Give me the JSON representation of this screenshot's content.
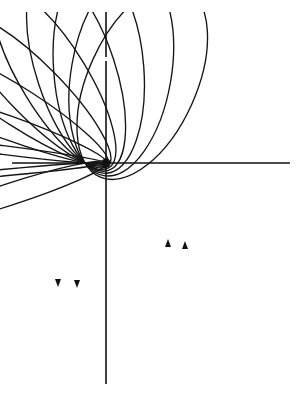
{
  "diagram": {
    "title": "",
    "colors": {
      "ink": "#151515",
      "background": "#ffffff"
    },
    "axes": {
      "horizontal": {
        "x1": 12,
        "x2": 290,
        "y": 163
      },
      "vertical": {
        "x": 106,
        "y1": 12,
        "y2": 384,
        "gap": [
          57,
          61
        ]
      }
    },
    "center_point": {
      "x": 106,
      "y": 163,
      "r": 4.5,
      "label": ""
    },
    "launch_point": {
      "x": 85,
      "y": 163
    },
    "semi_major_axis": 104,
    "launch_directions_deg": [
      -100,
      -93,
      -86,
      -79,
      -72,
      -65,
      -58,
      -51,
      -44,
      -37,
      -30
    ],
    "clip": {
      "x": 0,
      "y": 12,
      "width": 300,
      "height": 381
    },
    "arrows": [
      {
        "x": 168,
        "y": 244,
        "direction": "up"
      },
      {
        "x": 185,
        "y": 246,
        "direction": "up"
      },
      {
        "x": 58,
        "y": 282,
        "direction": "down"
      },
      {
        "x": 77,
        "y": 283,
        "direction": "down"
      }
    ]
  }
}
